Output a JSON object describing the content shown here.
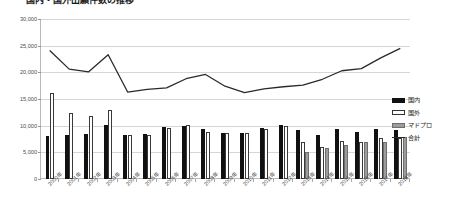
{
  "chart_data": {
    "type": "bar",
    "title": "国内・国外出願件数の推移",
    "xlabel": "",
    "ylabel": "",
    "ylim": [
      0,
      30000
    ],
    "ystep": 5000,
    "grid": true,
    "legend_position": "right",
    "ytick_labels": [
      "0",
      "5,000",
      "10,000",
      "15,000",
      "20,000",
      "25,000",
      "30,000"
    ],
    "categories": [
      "2000年",
      "2001年",
      "2002年",
      "2003年",
      "2004年",
      "2005年",
      "2006年",
      "2007年",
      "2008年",
      "2009年",
      "2010年",
      "2011年",
      "2012年",
      "2013年",
      "2014年",
      "2015年",
      "2016年",
      "2017年",
      "2018年"
    ],
    "series": [
      {
        "name": "国内",
        "style": "bar-filled-black",
        "color": "#111111",
        "values": [
          8000,
          8200,
          8500,
          10200,
          8300,
          8400,
          9700,
          9900,
          9300,
          8700,
          8600,
          9500,
          10100,
          9100,
          8300,
          9300,
          8900,
          9400,
          9100
        ]
      },
      {
        "name": "国外",
        "style": "bar-outline-white",
        "color": "#ffffff",
        "values": [
          16100,
          12400,
          11800,
          12900,
          8200,
          8200,
          9500,
          10200,
          8800,
          8700,
          8700,
          9300,
          9900,
          7000,
          6000,
          7100,
          7000,
          7700,
          7600
        ]
      },
      {
        "name": "マドプロ",
        "style": "bar-gray",
        "color": "#9c9c9c",
        "values": [
          0,
          0,
          0,
          0,
          0,
          0,
          0,
          0,
          0,
          0,
          0,
          0,
          0,
          5100,
          5800,
          6300,
          6900,
          7000,
          7800
        ]
      },
      {
        "name": "合計",
        "style": "line",
        "color": "#2a2a2a",
        "values": [
          24100,
          20600,
          20100,
          23300,
          16300,
          16800,
          17100,
          18800,
          19600,
          17400,
          16200,
          16900,
          17300,
          17600,
          18700,
          20300,
          20700,
          22700,
          24500
        ]
      }
    ]
  },
  "legend": {
    "items": [
      {
        "label": "国内",
        "swatch": "domestic"
      },
      {
        "label": "国外",
        "swatch": "foreign"
      },
      {
        "label": "マドプロ",
        "swatch": "madopro"
      },
      {
        "label": "合計",
        "swatch": "total"
      }
    ]
  }
}
